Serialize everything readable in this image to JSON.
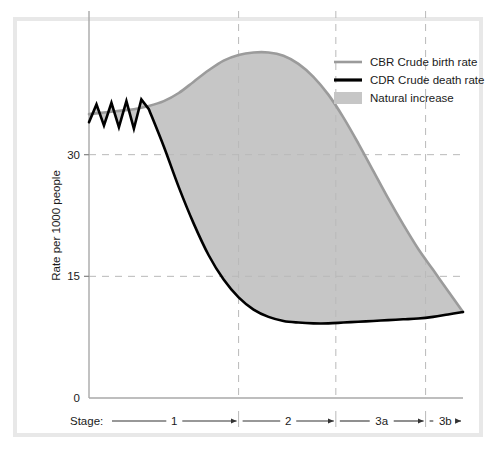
{
  "figure": {
    "background_color": "#ffffff",
    "frame_color": "#e8e8e8"
  },
  "chart_data": {
    "type": "line",
    "title": "",
    "subtitle": "",
    "xlabel": "Stage:",
    "ylabel": "Rate per 1000 people",
    "ylim": [
      0,
      45
    ],
    "xlim": [
      0,
      100
    ],
    "grid": true,
    "grid_style": "dashed",
    "grid_color": "#b9b9b9",
    "legend_position": "top-right",
    "y_ticks": [
      "0",
      "15",
      "30"
    ],
    "y_tick_values": [
      0,
      15,
      30
    ],
    "x_axis_kind": "stage-bands",
    "stages": [
      {
        "label": "1",
        "start": 0,
        "end": 40
      },
      {
        "label": "2",
        "start": 40,
        "end": 66
      },
      {
        "label": "3a",
        "start": 66,
        "end": 90
      },
      {
        "label": "3b",
        "start": 90,
        "end": 100
      }
    ],
    "legend": [
      {
        "key": "cbr",
        "label": "CBR Crude birth rate",
        "marker": "line",
        "color": "#9b9b9b"
      },
      {
        "key": "cdr",
        "label": "CDR Crude death rate",
        "marker": "line",
        "color": "#000000"
      },
      {
        "key": "natural_increase",
        "label": "Natural increase",
        "marker": "swatch",
        "color": "#c6c6c6"
      }
    ],
    "series": [
      {
        "name": "CBR Crude birth rate",
        "color": "#9b9b9b",
        "points": [
          [
            0,
            35.0
          ],
          [
            4,
            35.2
          ],
          [
            8,
            35.4
          ],
          [
            12,
            35.6
          ],
          [
            16,
            36.0
          ],
          [
            20,
            36.6
          ],
          [
            24,
            37.6
          ],
          [
            28,
            39.0
          ],
          [
            32,
            40.4
          ],
          [
            36,
            41.6
          ],
          [
            40,
            42.3
          ],
          [
            44,
            42.6
          ],
          [
            48,
            42.6
          ],
          [
            52,
            42.2
          ],
          [
            56,
            41.2
          ],
          [
            60,
            39.6
          ],
          [
            64,
            37.4
          ],
          [
            68,
            34.6
          ],
          [
            72,
            31.4
          ],
          [
            76,
            28.0
          ],
          [
            80,
            24.6
          ],
          [
            84,
            21.4
          ],
          [
            88,
            18.4
          ],
          [
            92,
            15.8
          ],
          [
            96,
            13.2
          ],
          [
            100,
            10.6
          ]
        ]
      },
      {
        "name": "CDR Crude death rate",
        "color": "#000000",
        "points": [
          [
            0,
            34.0
          ],
          [
            2,
            36.2
          ],
          [
            4,
            33.6
          ],
          [
            6,
            36.4
          ],
          [
            8,
            33.4
          ],
          [
            10,
            36.6
          ],
          [
            12,
            33.2
          ],
          [
            14,
            36.8
          ],
          [
            16,
            35.6
          ],
          [
            20,
            31.0
          ],
          [
            24,
            26.0
          ],
          [
            28,
            21.5
          ],
          [
            32,
            17.6
          ],
          [
            36,
            14.6
          ],
          [
            40,
            12.4
          ],
          [
            44,
            10.9
          ],
          [
            48,
            10.0
          ],
          [
            52,
            9.5
          ],
          [
            56,
            9.3
          ],
          [
            60,
            9.2
          ],
          [
            64,
            9.2
          ],
          [
            68,
            9.3
          ],
          [
            72,
            9.4
          ],
          [
            76,
            9.5
          ],
          [
            80,
            9.6
          ],
          [
            84,
            9.7
          ],
          [
            88,
            9.8
          ],
          [
            92,
            10.0
          ],
          [
            96,
            10.3
          ],
          [
            100,
            10.6
          ]
        ]
      }
    ],
    "fill_between": {
      "label": "Natural increase",
      "color": "#c6c6c6",
      "upper_series": "CBR Crude birth rate",
      "lower_series": "CDR Crude death rate"
    }
  }
}
